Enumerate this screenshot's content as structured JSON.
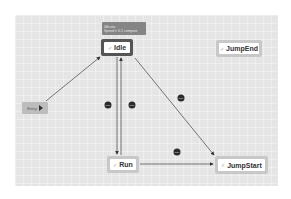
{
  "canvas": {
    "background": "#e5e5e5"
  },
  "tooltip": {
    "lines": [
      "Idle.sta",
      "Speed > 0.1 compare"
    ]
  },
  "nodes": {
    "idle": {
      "label": "Idle",
      "icon": "check-icon",
      "selected": true
    },
    "jump_end": {
      "label": "JumpEnd",
      "icon": "check-icon"
    },
    "run": {
      "label": "Run",
      "icon": "check-icon"
    },
    "jump_start": {
      "label": "JumpStart",
      "icon": "check-icon"
    },
    "entry": {
      "label": "Entry",
      "icon": "play-icon"
    }
  },
  "icons": {
    "check": "✓"
  },
  "edges": [
    {
      "from": "Entry",
      "to": "Idle"
    },
    {
      "from": "Idle",
      "to": "Run",
      "marker": "gate"
    },
    {
      "from": "Run",
      "to": "Idle",
      "marker": "gate"
    },
    {
      "from": "Idle",
      "to": "JumpStart",
      "marker": "gate"
    },
    {
      "from": "Run",
      "to": "JumpStart",
      "marker": "gate"
    }
  ],
  "marker_label": "gate"
}
